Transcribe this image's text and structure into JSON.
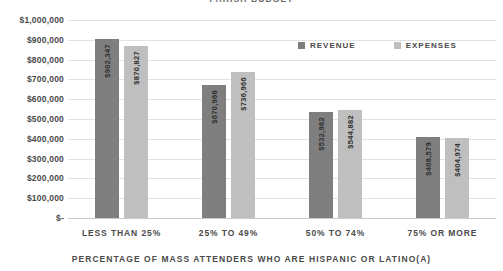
{
  "chart_data": {
    "type": "bar",
    "title": "PARISH BUDGET",
    "xlabel": "PERCENTAGE OF MASS ATTENDERS WHO ARE HISPANIC OR LATINO(A)",
    "ylabel": "",
    "ylim": [
      0,
      1000000
    ],
    "grid": true,
    "legend_position": "top-right",
    "categories": [
      "LESS THAN 25%",
      "25% TO 49%",
      "50% TO 74%",
      "75% OR MORE"
    ],
    "ytick_labels": [
      "$1,000,000",
      "$900,000",
      "$800,000",
      "$700,000",
      "$600,000",
      "$500,000",
      "$400,000",
      "$300,000",
      "$200,000",
      "$100,000",
      "$-"
    ],
    "ytick_values": [
      1000000,
      900000,
      800000,
      700000,
      600000,
      500000,
      400000,
      300000,
      200000,
      100000,
      0
    ],
    "series": [
      {
        "name": "REVENUE",
        "color": "#7f7f7f",
        "values": [
          902347,
          870827,
          532982,
          408579
        ],
        "labels": [
          "$902,347",
          "$870,827",
          "$532,982",
          "$408,579"
        ]
      },
      {
        "name": "EXPENSES",
        "color": "#bfbfbf",
        "values": [
          870827,
          736966,
          544882,
          404974
        ],
        "labels": [
          "$870,827",
          "$736,966",
          "$544,882",
          "$404,974"
        ]
      }
    ],
    "bar_groups": [
      {
        "category": "LESS THAN 25%",
        "revenue_value": 902347,
        "revenue_label": "$902,347",
        "expenses_value": 870827,
        "expenses_label": "$870,827"
      },
      {
        "category": "25% TO 49%",
        "revenue_value": 670968,
        "revenue_label": "$670,968",
        "expenses_value": 736966,
        "expenses_label": "$736,966"
      },
      {
        "category": "50% TO 74%",
        "revenue_value": 532982,
        "revenue_label": "$532,982",
        "expenses_value": 544882,
        "expenses_label": "$544,882"
      },
      {
        "category": "75% OR MORE",
        "revenue_value": 408579,
        "revenue_label": "$408,579",
        "expenses_value": 404974,
        "expenses_label": "$404,974"
      }
    ],
    "legend": [
      {
        "label": "REVENUE",
        "color": "#7f7f7f"
      },
      {
        "label": "EXPENSES",
        "color": "#bfbfbf"
      }
    ]
  }
}
